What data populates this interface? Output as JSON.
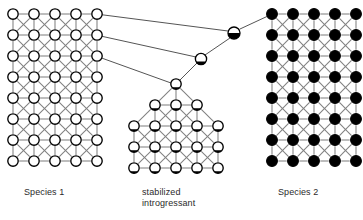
{
  "figure": {
    "type": "genetic-introgression-diagram",
    "background_color": "#ffffff",
    "lattice_edge_color": "#808080",
    "node_outline_color": "#000000",
    "node_fill_empty": "#ffffff",
    "node_fill_full": "#000000",
    "connector_color": "#555555"
  },
  "captions": {
    "species_1": "Species 1",
    "introgressant": "stabilized\nintrogressant",
    "species_2": "Species 2"
  },
  "panels": {
    "left": {
      "name": "Species 1",
      "columns": 5,
      "rows": 8,
      "node_state": "open",
      "fill_fraction": 0.0,
      "origin_x": 13,
      "origin_y": 14,
      "step_x": 21,
      "step_y": 21,
      "radius": 5.2
    },
    "middle": {
      "name": "stabilized introgressant",
      "shape": "pyramid",
      "row_counts": [
        1,
        3,
        5,
        5,
        5
      ],
      "node_state": "partial",
      "fill_fraction": 0.18,
      "apex_x": 176,
      "apex_y": 84,
      "step_x": 21,
      "step_y": 21,
      "radius": 5.2
    },
    "right": {
      "name": "Species 2",
      "columns": 5,
      "rows": 8,
      "node_state": "filled",
      "fill_fraction": 1.0,
      "origin_x": 272,
      "origin_y": 14,
      "step_x": 21,
      "step_y": 21,
      "radius": 5.4
    }
  },
  "hybrid_nodes": [
    {
      "id": "hybrid-f1",
      "x": 234,
      "y": 33,
      "radius": 6.0,
      "fill_fraction": 0.5,
      "label": "F1 hybrid"
    },
    {
      "id": "backcross-1",
      "x": 201,
      "y": 59,
      "radius": 5.6,
      "fill_fraction": 0.28,
      "label": "backcross 1"
    }
  ],
  "connectors": [
    {
      "from": "species1-row1-col5",
      "to": "hybrid-f1",
      "x1": 96,
      "y1": 14,
      "x2": 228,
      "y2": 31
    },
    {
      "from": "species1-row2-col5",
      "to": "backcross-1",
      "x1": 96,
      "y1": 35,
      "x2": 196,
      "y2": 57
    },
    {
      "from": "species1-row3-col5",
      "to": "pyramid-apex",
      "x1": 96,
      "y1": 56,
      "x2": 171,
      "y2": 83
    },
    {
      "from": "hybrid-f1",
      "to": "species2-row1-col1",
      "x1": 240,
      "y1": 29,
      "x2": 268,
      "y2": 16
    },
    {
      "from": "backcross-1",
      "to": "hybrid-f1",
      "x1": 205,
      "y1": 55,
      "x2": 230,
      "y2": 38
    },
    {
      "from": "pyramid-apex",
      "to": "backcross-1",
      "x1": 180,
      "y1": 80,
      "x2": 197,
      "y2": 63
    }
  ]
}
